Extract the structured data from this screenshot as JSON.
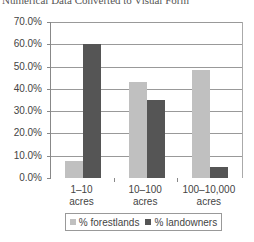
{
  "chart_data": {
    "type": "bar",
    "title": "Numerical Data Converted to Visual Form",
    "xlabel": "",
    "ylabel": "",
    "categories": [
      "1–10 acres",
      "10–100 acres",
      "100–10,000 acres"
    ],
    "category_lines": [
      [
        "1–10",
        "acres"
      ],
      [
        "10–100",
        "acres"
      ],
      [
        "100–10,000",
        "acres"
      ]
    ],
    "series": [
      {
        "name": "% forestlands",
        "color": "#c0c0c0",
        "values": [
          7.7,
          43.3,
          48.6
        ]
      },
      {
        "name": "% landowners",
        "color": "#555555",
        "values": [
          60.0,
          34.8,
          5.0
        ]
      }
    ],
    "ylim": [
      0,
      70
    ],
    "yticks": [
      "0.0%",
      "10.0%",
      "20.0%",
      "30.0%",
      "40.0%",
      "50.0%",
      "60.0%",
      "70.0%"
    ],
    "grid": true,
    "legend_position": "bottom"
  }
}
